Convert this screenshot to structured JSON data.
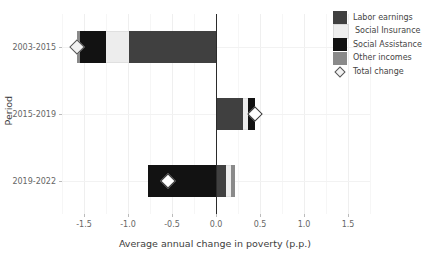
{
  "chart_data": {
    "type": "bar",
    "orientation": "horizontal",
    "stacked": true,
    "title": "",
    "xlabel": "Average annual change in poverty (p.p.)",
    "ylabel": "Period",
    "categories": [
      "2003-2015",
      "2015-2019",
      "2019-2022"
    ],
    "xlim": [
      -1.75,
      1.75
    ],
    "xticks": [
      -1.5,
      -1.0,
      -0.5,
      0.0,
      0.5,
      1.0,
      1.5
    ],
    "xticklabels": [
      "-1.5",
      "-1.0",
      "-0.5",
      "0.0",
      "0.5",
      "1.0",
      "1.5"
    ],
    "grid": true,
    "legend_position": "top-right",
    "series": [
      {
        "name": "Labor earnings",
        "color": "#404040",
        "values": [
          -0.99,
          0.31,
          0.11
        ]
      },
      {
        "name": "Social Insurance",
        "color": "#ededed",
        "values": [
          -0.26,
          0.05,
          0.06
        ]
      },
      {
        "name": "Social Assistance",
        "color": "#121212",
        "values": [
          -0.29,
          0.08,
          -0.77
        ]
      },
      {
        "name": "Other incomes",
        "color": "#8a8a8a",
        "values": [
          -0.04,
          0.0,
          0.05
        ]
      }
    ],
    "totals": {
      "name": "Total change",
      "marker": "diamond",
      "values": [
        -1.58,
        0.44,
        -0.55
      ]
    },
    "segments": [
      {
        "category": "2003-2015",
        "negative_order": [
          "Other incomes",
          "Social Assistance",
          "Social Insurance",
          "Labor earnings"
        ],
        "parts": [
          {
            "series": "Other incomes",
            "value": -0.04,
            "start": -1.58,
            "end": -1.54
          },
          {
            "series": "Social Assistance",
            "value": -0.29,
            "start": -1.54,
            "end": -1.25
          },
          {
            "series": "Social Insurance",
            "value": -0.26,
            "start": -1.25,
            "end": -0.99
          },
          {
            "series": "Labor earnings",
            "value": -0.99,
            "start": -0.99,
            "end": 0.0
          }
        ]
      },
      {
        "category": "2015-2019",
        "positive_order": [
          "Labor earnings",
          "Social Insurance",
          "Social Assistance"
        ],
        "parts": [
          {
            "series": "Labor earnings",
            "value": 0.31,
            "start": 0.0,
            "end": 0.31
          },
          {
            "series": "Social Insurance",
            "value": 0.05,
            "start": 0.31,
            "end": 0.36
          },
          {
            "series": "Social Assistance",
            "value": 0.08,
            "start": 0.36,
            "end": 0.44
          }
        ]
      },
      {
        "category": "2019-2022",
        "negative_order": [
          "Social Assistance"
        ],
        "positive_order": [
          "Labor earnings",
          "Social Insurance",
          "Other incomes"
        ],
        "parts": [
          {
            "series": "Social Assistance",
            "value": -0.77,
            "start": -0.77,
            "end": 0.0
          },
          {
            "series": "Labor earnings",
            "value": 0.11,
            "start": 0.0,
            "end": 0.11
          },
          {
            "series": "Social Insurance",
            "value": 0.06,
            "start": 0.11,
            "end": 0.17
          },
          {
            "series": "Other incomes",
            "value": 0.05,
            "start": 0.17,
            "end": 0.22
          }
        ]
      }
    ]
  },
  "axes": {
    "ylabel": "Period",
    "xlabel": "Average annual change in poverty (p.p.)",
    "ytick_0": "2003-2015",
    "ytick_1": "2015-2019",
    "ytick_2": "2019-2022",
    "xtick_0": "-1.5",
    "xtick_1": "-1.0",
    "xtick_2": "-0.5",
    "xtick_3": "0.0",
    "xtick_4": "0.5",
    "xtick_5": "1.0",
    "xtick_6": "1.5"
  },
  "legend": {
    "items": [
      {
        "label": "Labor earnings",
        "color": "#404040"
      },
      {
        "label": "Social Insurance",
        "color": "#ededed"
      },
      {
        "label": "Social Assistance",
        "color": "#121212"
      },
      {
        "label": "Other incomes",
        "color": "#8a8a8a"
      }
    ],
    "total_label": "Total change"
  }
}
